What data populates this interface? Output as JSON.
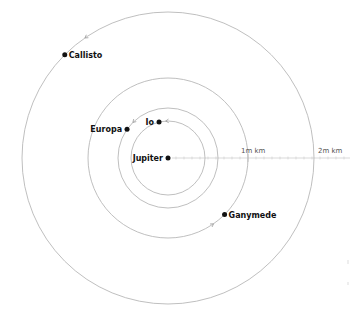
{
  "diagram": {
    "center": {
      "name": "Jupiter"
    },
    "moons": [
      {
        "name": "Io",
        "orbit_km": 421700,
        "angle_deg": 104
      },
      {
        "name": "Europa",
        "orbit_km": 671000,
        "angle_deg": 145
      },
      {
        "name": "Ganymede",
        "orbit_km": 1070400,
        "angle_deg": -45
      },
      {
        "name": "Callisto",
        "orbit_km": 1882700,
        "angle_deg": 135
      }
    ],
    "scale": [
      {
        "label": "1m km",
        "value_km": 1000000
      },
      {
        "label": "2m km",
        "value_km": 2000000
      }
    ],
    "colors": {
      "orbit": "#b8b8b8",
      "body": "#111111",
      "scale": "#cfcfcf"
    }
  }
}
